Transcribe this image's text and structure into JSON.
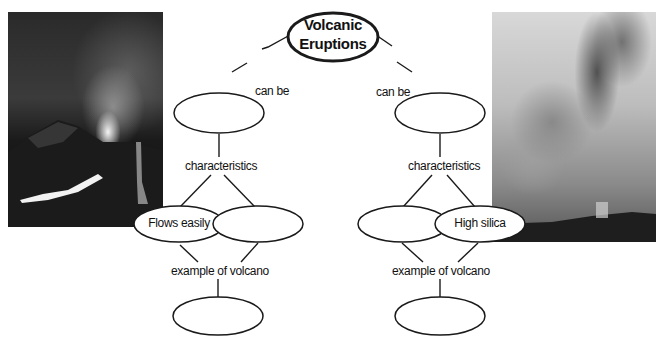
{
  "diagram": {
    "type": "concept-map",
    "root": {
      "label_line1": "Volcanic",
      "label_line2": "Eruptions"
    },
    "left_branch": {
      "link_label": "can be",
      "type_node": "",
      "characteristics_label": "characteristics",
      "characteristic_nodes": [
        "Flows easily",
        ""
      ],
      "example_label": "example of volcano",
      "example_node": ""
    },
    "right_branch": {
      "link_label": "can be",
      "type_node": "",
      "characteristics_label": "characteristics",
      "characteristic_nodes": [
        "",
        "High silica"
      ],
      "example_label": "example of volcano",
      "example_node": ""
    },
    "images": {
      "left": "lava-fountain-eruption-photo",
      "right": "ash-column-eruption-photo"
    }
  }
}
